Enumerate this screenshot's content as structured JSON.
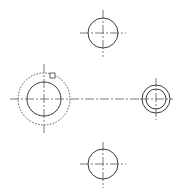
{
  "drawing": {
    "background": "#ffffff",
    "line_color": "#3a3a3a",
    "holes": [
      {
        "id": "top",
        "cx": 103,
        "cy": 33,
        "r": 15,
        "cross": {
          "x1": 80,
          "x2": 126,
          "y1": 10,
          "y2": 57
        }
      },
      {
        "id": "left",
        "cx": 44,
        "cy": 99,
        "r": 17,
        "outer_dashed_r": 26,
        "cross": {
          "x1": 10,
          "x2": 70,
          "y1": 64,
          "y2": 134
        }
      },
      {
        "id": "right",
        "cx": 156,
        "cy": 99,
        "r": 14,
        "inner_r": 10,
        "cross": {
          "x1": 140,
          "x2": 173,
          "y1": 78,
          "y2": 120
        }
      },
      {
        "id": "bottom",
        "cx": 103,
        "cy": 164,
        "r": 15,
        "cross": {
          "x1": 80,
          "x2": 126,
          "y1": 142,
          "y2": 188
        }
      }
    ],
    "center_line": {
      "x1": 70,
      "x2": 140,
      "y": 99
    },
    "grip": {
      "x": 50,
      "y": 73,
      "size": 5
    }
  }
}
